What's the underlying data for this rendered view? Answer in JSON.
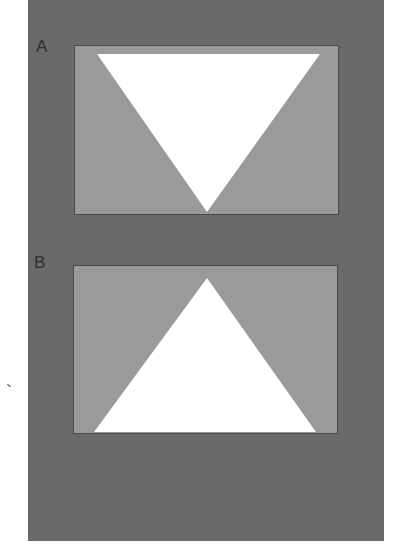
{
  "figure": {
    "colors": {
      "background": "#ffffff",
      "outer_mat": "#6a6a6a",
      "panel_fill": "#9a9a9a",
      "panel_edge": "#4a4a4a",
      "triangle": "#ffffff",
      "label": "#2e2e2e"
    },
    "panels": [
      {
        "label": "A",
        "orientation": "inverted-triangle",
        "triangle_points": "23,9 246,9 133,167"
      },
      {
        "label": "B",
        "orientation": "upright-triangle",
        "triangle_points": "134,13 21,167 243,167"
      }
    ]
  }
}
